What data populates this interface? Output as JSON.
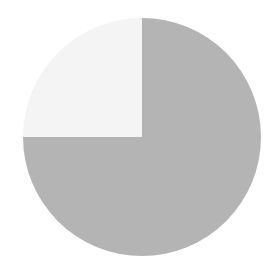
{
  "chart_data": {
    "type": "pie",
    "title": "",
    "categories": [
      "Slice A",
      "Slice B"
    ],
    "values": [
      75,
      25
    ],
    "colors": [
      "#b4b4b4",
      "#f4f4f4"
    ],
    "start_angle_deg": 0,
    "direction": "clockwise_from_top",
    "legend": "none",
    "labels_shown": false
  },
  "layout": {
    "cx": 142,
    "cy": 137,
    "r": 119,
    "background": "#ffffff"
  }
}
